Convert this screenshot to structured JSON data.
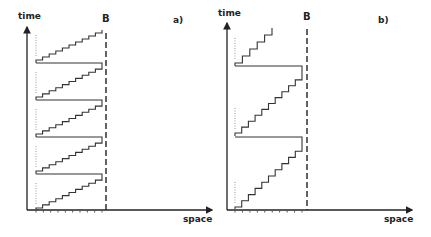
{
  "panels": [
    {
      "id": "a",
      "panel_label": "a)",
      "y_axis_label": "time",
      "x_axis_label": "space",
      "boundary_label": "B",
      "origin": [
        27,
        210
      ],
      "y_axis_top": 27,
      "x_axis_end": 212,
      "boundary_x": 106,
      "stair_left": 36,
      "stair_right": 102,
      "label_pos": {
        "time": [
          18,
          19
        ],
        "B": [
          102,
          22
        ],
        "panel": [
          173,
          23
        ],
        "space": [
          183,
          222
        ]
      },
      "cycles": [
        {
          "bottom": 208,
          "top": 177,
          "steps": 10,
          "return_y": 174
        },
        {
          "bottom": 171,
          "top": 140,
          "steps": 10,
          "return_y": 137
        },
        {
          "bottom": 134,
          "top": 103,
          "steps": 10,
          "return_y": 100
        },
        {
          "bottom": 97,
          "top": 66,
          "steps": 10,
          "return_y": 63
        },
        {
          "bottom": 60,
          "top": 30,
          "steps": 10,
          "return_y": null
        }
      ],
      "ticks": 9
    },
    {
      "id": "b",
      "panel_label": "b)",
      "y_axis_label": "time",
      "x_axis_label": "space",
      "boundary_label": "B",
      "origin": [
        227,
        210
      ],
      "y_axis_top": 23,
      "x_axis_end": 412,
      "boundary_x": 307,
      "stair_left": 235,
      "stair_right": 302,
      "label_pos": {
        "time": [
          218,
          16
        ],
        "B": [
          303,
          20
        ],
        "panel": [
          378,
          23
        ],
        "space": [
          384,
          222
        ]
      },
      "cycles": [
        {
          "bottom": 207,
          "top": 145,
          "steps": 10,
          "return_y": 137
        },
        {
          "bottom": 133,
          "top": 74,
          "steps": 10,
          "return_y": 66
        },
        {
          "bottom": 63,
          "top": 28,
          "steps": 5,
          "return_y": null,
          "partial_right": 272
        }
      ],
      "ticks": 9
    }
  ]
}
